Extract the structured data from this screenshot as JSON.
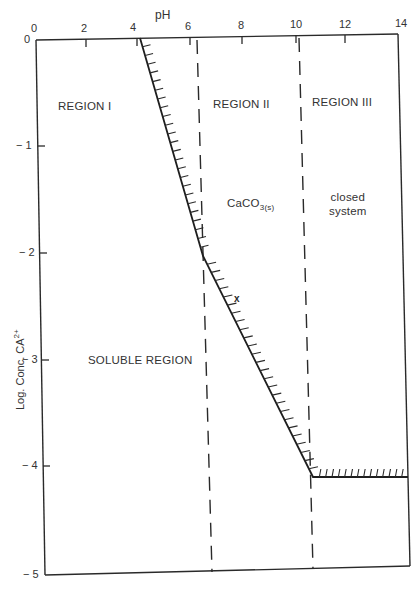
{
  "chart_data": {
    "type": "line",
    "title": "",
    "xlabel": "pH",
    "ylabel": "Log. Conc. CA2+",
    "xlim": [
      0,
      14
    ],
    "ylim": [
      -5,
      0
    ],
    "x_ticks": [
      "0",
      "2",
      "4",
      "6",
      "8",
      "10",
      "12",
      "14"
    ],
    "y_ticks": [
      "0",
      "−1",
      "−2",
      "−3",
      "−4",
      "−5"
    ],
    "grid": false,
    "legend": null,
    "series": [
      {
        "name": "CaCO3 solubility boundary (hatched)",
        "style": "solid-hatched",
        "x": [
          4.1,
          6.3,
          8.2,
          10.5,
          14.0
        ],
        "y": [
          0.0,
          -1.9,
          -2.5,
          -4.1,
          -4.1
        ]
      },
      {
        "name": "region boundary pH 6.3",
        "style": "dashed",
        "x": [
          6.3,
          6.3
        ],
        "y": [
          0,
          -5
        ]
      },
      {
        "name": "region boundary pH 10.3",
        "style": "dashed",
        "x": [
          10.3,
          10.3
        ],
        "y": [
          0,
          -5
        ]
      }
    ],
    "annotations": [
      {
        "text": "REGION I",
        "x": 2.3,
        "y": -0.45
      },
      {
        "text": "REGION II",
        "x": 8.2,
        "y": -0.45
      },
      {
        "text": "REGION III",
        "x": 12.0,
        "y": -0.45
      },
      {
        "text": "CaCO3(s)",
        "x": 8.3,
        "y": -1.6
      },
      {
        "text": "closed system",
        "x": 12.0,
        "y": -1.6
      },
      {
        "text": "SOLUBLE REGION",
        "x": 4.0,
        "y": -3.2
      },
      {
        "text": "x",
        "x": 8.4,
        "y": -2.4
      }
    ]
  },
  "axes": {
    "xlabel": "pH",
    "ylabel_main": "Log. Conc. CA",
    "ylabel_sup": "2+",
    "x_ticks": [
      {
        "label": "0",
        "x": 36
      },
      {
        "label": "2",
        "x": 86
      },
      {
        "label": "4",
        "x": 138
      },
      {
        "label": "6",
        "x": 190
      },
      {
        "label": "8",
        "x": 242
      },
      {
        "label": "10",
        "x": 296
      },
      {
        "label": "12",
        "x": 345
      },
      {
        "label": "14",
        "x": 398
      }
    ],
    "y_ticks": [
      {
        "label": "0",
        "y": 40
      },
      {
        "label": "− 1",
        "y": 146
      },
      {
        "label": "− 2",
        "y": 253
      },
      {
        "label": "− 3",
        "y": 360
      },
      {
        "label": "− 4",
        "y": 466
      },
      {
        "label": "− 5",
        "y": 575
      }
    ]
  },
  "labels": {
    "region1": "REGION I",
    "region2": "REGION II",
    "region3": "REGION III",
    "caco3_main": "CaCO",
    "caco3_sub": "3(s)",
    "closed_line1": "closed",
    "closed_line2": "system",
    "soluble": "SOLUBLE REGION",
    "marker": "x"
  },
  "colors": {
    "ink": "#2a2a2a",
    "background": "#ffffff"
  }
}
